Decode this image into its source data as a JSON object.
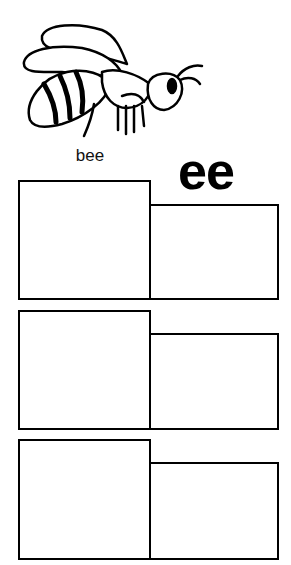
{
  "worksheet": {
    "picture": {
      "subject": "bee",
      "icon": "bee-icon"
    },
    "word_label": "bee",
    "digraph": "ee",
    "rows": [
      {
        "left_box": "",
        "right_box": ""
      },
      {
        "left_box": "",
        "right_box": ""
      },
      {
        "left_box": "",
        "right_box": ""
      }
    ],
    "colors": {
      "line": "#000000",
      "background": "#ffffff"
    }
  }
}
